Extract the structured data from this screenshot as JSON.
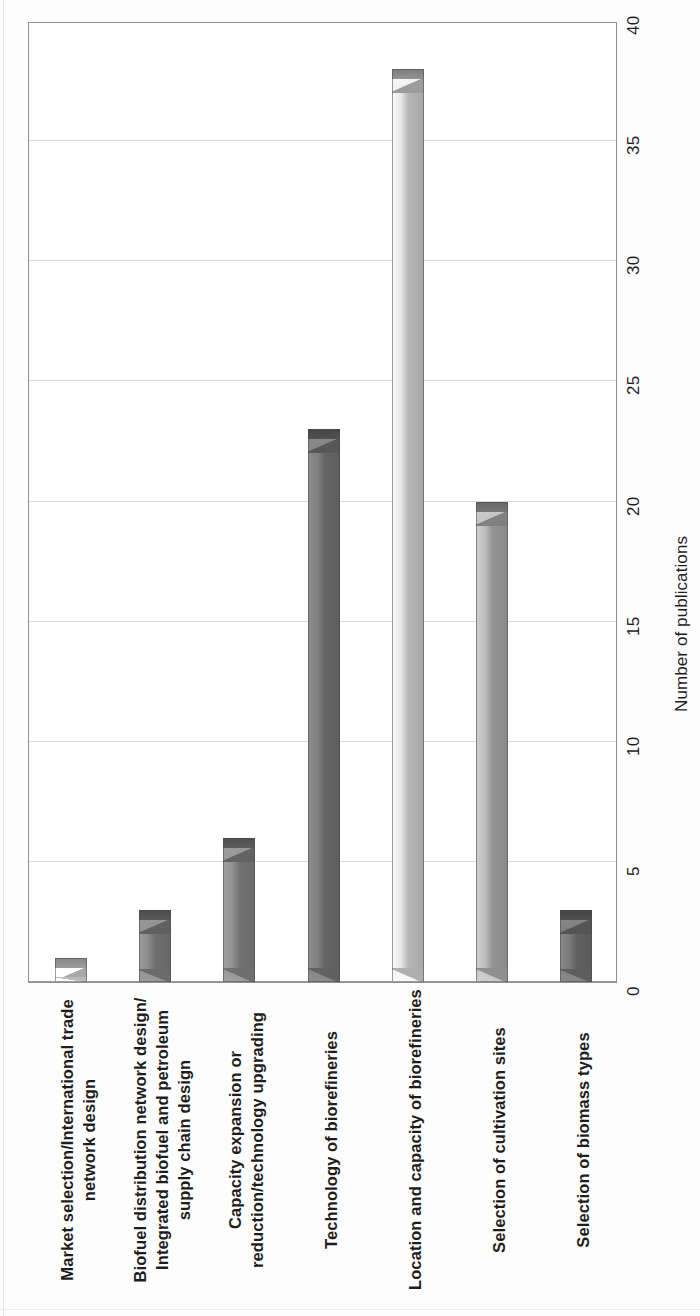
{
  "chart_data": {
    "type": "bar",
    "title": "",
    "subtitle": "",
    "orientation": "vertical-bars-rotated-page",
    "xlabel": "",
    "ylabel": "Number of publications",
    "ylim": [
      0,
      40
    ],
    "ytick_step": 5,
    "grid": true,
    "legend": null,
    "categories": [
      "Market selection/International trade\nnetwork design",
      "Biofuel distribution network design/\nIntegrated biofuel and petroleum\nsupply chain design",
      "Capacity expansion or\nreduction/technology upgrading",
      "Technology of biorefineries",
      "Location and capacity of biorefineries",
      "Selection of cultivation sites",
      "Selection of biomass types"
    ],
    "values": [
      1,
      3,
      6,
      23,
      38,
      20,
      3
    ],
    "tick_labels": [
      "0",
      "5",
      "10",
      "15",
      "20",
      "25",
      "30",
      "35",
      "40"
    ],
    "tick_values": [
      0,
      5,
      10,
      15,
      20,
      25,
      30,
      35,
      40
    ],
    "bar_colors": [
      "#f2f2f2",
      "#8a8a8a",
      "#8f8f8f",
      "#7e7e7e",
      "#e2e2e2",
      "#b9b9b9",
      "#7a7a7a"
    ],
    "bar_edge_color": "#4a4a4a",
    "grid_color": "#d9d9d9",
    "axis_color": "#8f8f8f",
    "text_color": "#1d1d1d",
    "background": "#ffffff"
  }
}
